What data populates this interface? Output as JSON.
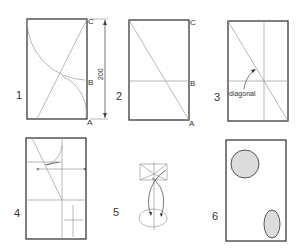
{
  "panels": [
    {
      "number": "1",
      "points": {
        "A": "A",
        "B": "B",
        "C": "C"
      },
      "dimension": "200"
    },
    {
      "number": "2",
      "points": {
        "A": "A",
        "B": "B",
        "C": "C"
      }
    },
    {
      "number": "3",
      "annotation": "diagonal"
    },
    {
      "number": "4"
    },
    {
      "number": "5"
    },
    {
      "number": "6"
    }
  ],
  "colors": {
    "outline": "#3a3a3a",
    "construction": "#9a9a9a",
    "fill": "#dcdcdc"
  }
}
